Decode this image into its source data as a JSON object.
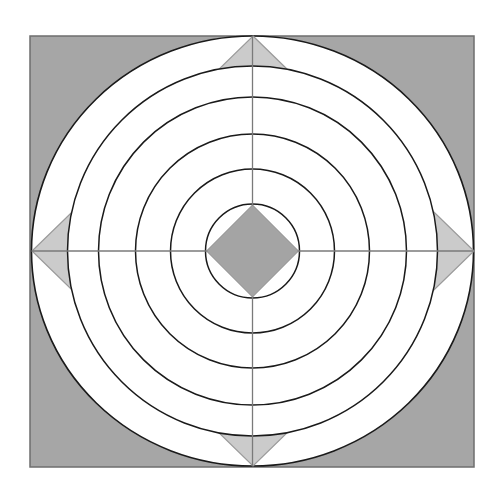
{
  "diagram": {
    "type": "geometric-figure",
    "frame": {
      "x": 30,
      "y": 36,
      "width": 444,
      "height": 431,
      "fill": "#a6a6a6",
      "stroke": "#6e6e6e"
    },
    "center": {
      "x": 252.5,
      "y": 251
    },
    "outer_circle": {
      "rx": 221,
      "ry": 215,
      "fill": "#ffffff",
      "stroke": "#1a1a1a"
    },
    "large_diamond": {
      "points": [
        [
          253,
          36
        ],
        [
          474,
          251
        ],
        [
          253,
          466
        ],
        [
          32,
          251
        ]
      ],
      "fill": "#cbcbcb",
      "stroke": "#9a9a9a"
    },
    "circles": [
      {
        "r": 185,
        "fill": "#ffffff"
      },
      {
        "r": 154,
        "fill": "none"
      },
      {
        "r": 117,
        "fill": "none"
      },
      {
        "r": 82,
        "fill": "none"
      },
      {
        "r": 47,
        "fill": "none"
      }
    ],
    "circle_stroke": "#1a1a1a",
    "axis_stroke": "#7a7a7a",
    "small_diamond": {
      "half_diagonal": 46,
      "fill": "#a4a4a4",
      "stroke": "#8a8a8a"
    }
  }
}
